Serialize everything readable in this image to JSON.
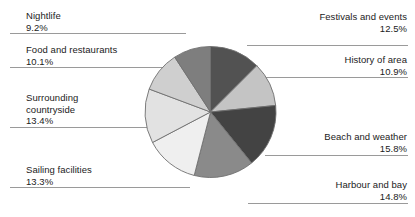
{
  "chart_data": {
    "type": "pie",
    "title": "",
    "subtitle": "",
    "xlabel": "",
    "ylabel": "",
    "legend_position": "callout-labels",
    "grid": false,
    "units": "percent",
    "start_angle_deg": 0,
    "direction": "clockwise",
    "categories": [
      "Festivals and events",
      "History of area",
      "Beach and weather",
      "Harbour and bay",
      "Sailing facilities",
      "Surrounding countryside",
      "Food and restaurants",
      "Nightlife"
    ],
    "values": [
      12.5,
      10.9,
      15.8,
      14.8,
      13.3,
      13.4,
      10.1,
      9.2
    ],
    "slices": [
      {
        "label": "Festivals and events",
        "value": 12.5,
        "value_text": "12.5%",
        "color": "#525252"
      },
      {
        "label": "History of area",
        "value": 10.9,
        "value_text": "10.9%",
        "color": "#c4c4c4"
      },
      {
        "label": "Beach and weather",
        "value": 15.8,
        "value_text": "15.8%",
        "color": "#434343"
      },
      {
        "label": "Harbour and bay",
        "value": 14.8,
        "value_text": "14.8%",
        "color": "#8a8a8a"
      },
      {
        "label": "Sailing facilities",
        "value": 13.3,
        "value_text": "13.3%",
        "color": "#efefef"
      },
      {
        "label": "Surrounding countryside",
        "value": 13.4,
        "value_text": "13.4%",
        "color": "#e2e2e2"
      },
      {
        "label": "Food and restaurants",
        "value": 10.1,
        "value_text": "10.1%",
        "color": "#cfcfcf"
      },
      {
        "label": "Nightlife",
        "value": 9.2,
        "value_text": "9.2%",
        "color": "#7e7e7e"
      }
    ]
  },
  "callouts": {
    "left": [
      {
        "name": "Nightlife",
        "percent": "9.2%",
        "line2": ""
      },
      {
        "name": "Food and restaurants",
        "percent": "10.1%",
        "line2": ""
      },
      {
        "name": "Surrounding",
        "percent": "13.4%",
        "line2": "countryside"
      },
      {
        "name": "Sailing facilities",
        "percent": "13.3%",
        "line2": ""
      }
    ],
    "right": [
      {
        "name": "Festivals and events",
        "percent": "12.5%",
        "line2": ""
      },
      {
        "name": "History of area",
        "percent": "10.9%",
        "line2": ""
      },
      {
        "name": "Beach and weather",
        "percent": "15.8%",
        "line2": ""
      },
      {
        "name": "Harbour and bay",
        "percent": "14.8%",
        "line2": ""
      }
    ]
  },
  "style": {
    "slice_outline": "#6f6f6f",
    "leader_line": "#9a9a9a",
    "text_color": "#1b1b1b",
    "background": "#ffffff"
  }
}
